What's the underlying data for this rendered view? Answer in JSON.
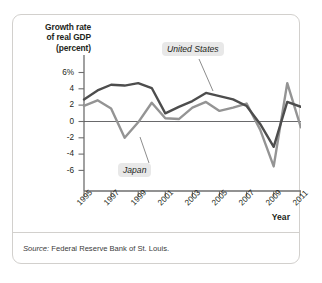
{
  "figure": {
    "y_axis_title_lines": [
      "Growth rate",
      "of real GDP",
      "(percent)"
    ],
    "x_axis_title": "Year",
    "source_prefix": "Source:",
    "source_text": "Federal Reserve Bank of St. Louis.",
    "colors": {
      "united_states": "#4d4d4d",
      "japan": "#949494",
      "axis": "#6e6e6e",
      "border": "#d2d0cd",
      "label_background": "#e8e8e8"
    }
  },
  "chart_data": {
    "type": "line",
    "title": "",
    "xlabel": "Year",
    "ylabel": "Growth rate of real GDP (percent)",
    "xlim": [
      1995,
      2011
    ],
    "ylim": [
      -7,
      7
    ],
    "ytick_labels": [
      "6%",
      "4",
      "2",
      "0",
      "-2",
      "-4",
      "-6"
    ],
    "ytick_values": [
      6,
      4,
      2,
      0,
      -2,
      -4,
      -6
    ],
    "xtick_labels": [
      "1995",
      "1997",
      "1999",
      "2001",
      "2003",
      "2005",
      "2007",
      "2009",
      "2011"
    ],
    "xtick_values": [
      1995,
      1997,
      1999,
      2001,
      2003,
      2005,
      2007,
      2009,
      2011
    ],
    "grid": false,
    "zero_line": true,
    "legend_position": "inline-annotation",
    "x": [
      1995,
      1996,
      1997,
      1998,
      1999,
      2000,
      2001,
      2002,
      2003,
      2004,
      2005,
      2006,
      2007,
      2008,
      2009,
      2010,
      2011
    ],
    "series": [
      {
        "name": "United States",
        "color": "#4d4d4d",
        "values": [
          2.7,
          3.8,
          4.5,
          4.4,
          4.7,
          4.1,
          1.0,
          1.8,
          2.5,
          3.5,
          3.1,
          2.7,
          1.9,
          -0.3,
          -3.1,
          2.4,
          1.8
        ]
      },
      {
        "name": "Japan",
        "color": "#949494",
        "values": [
          1.9,
          2.6,
          1.6,
          -2.0,
          -0.1,
          2.3,
          0.4,
          0.3,
          1.7,
          2.4,
          1.3,
          1.7,
          2.2,
          -1.0,
          -5.5,
          4.7,
          -0.7
        ]
      }
    ],
    "annotations": [
      {
        "label": "United States",
        "series": "United States",
        "anchor_year": 2004
      },
      {
        "label": "Japan",
        "series": "Japan",
        "anchor_year": 1999
      }
    ]
  }
}
